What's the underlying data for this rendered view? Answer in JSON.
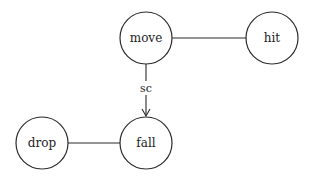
{
  "diagram": {
    "type": "graph",
    "nodes": [
      {
        "id": "move",
        "label": "move",
        "cx": 146,
        "cy": 38,
        "r": 26
      },
      {
        "id": "hit",
        "label": "hit",
        "cx": 272,
        "cy": 38,
        "r": 26
      },
      {
        "id": "drop",
        "label": "drop",
        "cx": 42,
        "cy": 143,
        "r": 26
      },
      {
        "id": "fall",
        "label": "fall",
        "cx": 146,
        "cy": 143,
        "r": 26
      }
    ],
    "edges": [
      {
        "from": "move",
        "to": "hit",
        "directed": false,
        "label": ""
      },
      {
        "from": "move",
        "to": "fall",
        "directed": true,
        "label": "sc"
      },
      {
        "from": "drop",
        "to": "fall",
        "directed": false,
        "label": ""
      }
    ],
    "colors": {
      "stroke": "#2a2a2a",
      "background": "#ffffff",
      "text": "#222222"
    }
  }
}
